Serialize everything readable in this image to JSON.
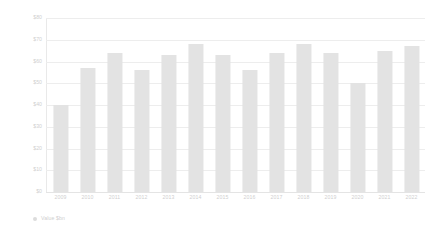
{
  "chart_data": {
    "type": "bar",
    "title": "",
    "xlabel": "",
    "ylabel": "$ Billion",
    "ylim": [
      0,
      80
    ],
    "ytick_step": 10,
    "grid": true,
    "legend_position": "bottom-left",
    "legend": [
      {
        "name": "Value  $bn",
        "color": "#e3e3e3",
        "marker": "circle"
      }
    ],
    "ytick_labels": [
      "$80",
      "$70",
      "$60",
      "$50",
      "$40",
      "$30",
      "$20",
      "$10",
      "$0"
    ],
    "ytick_values": [
      80,
      70,
      60,
      50,
      40,
      30,
      20,
      10,
      0
    ],
    "categories": [
      "2009",
      "2010",
      "2011",
      "2012",
      "2013",
      "2014",
      "2015",
      "2016",
      "2017",
      "2018",
      "2019",
      "2020",
      "2021",
      "2022"
    ],
    "series": [
      {
        "name": "Value  $bn",
        "color": "#e3e3e3",
        "values": [
          40,
          57,
          64,
          56,
          63,
          68,
          63,
          56,
          64,
          68,
          64,
          50,
          65,
          67
        ]
      }
    ]
  },
  "axis": {
    "y_title": "$ Billion"
  },
  "colors": {
    "bar": "#e3e3e3",
    "grid": "#ededed",
    "text": "#cfcfcf",
    "background": "#ffffff"
  }
}
